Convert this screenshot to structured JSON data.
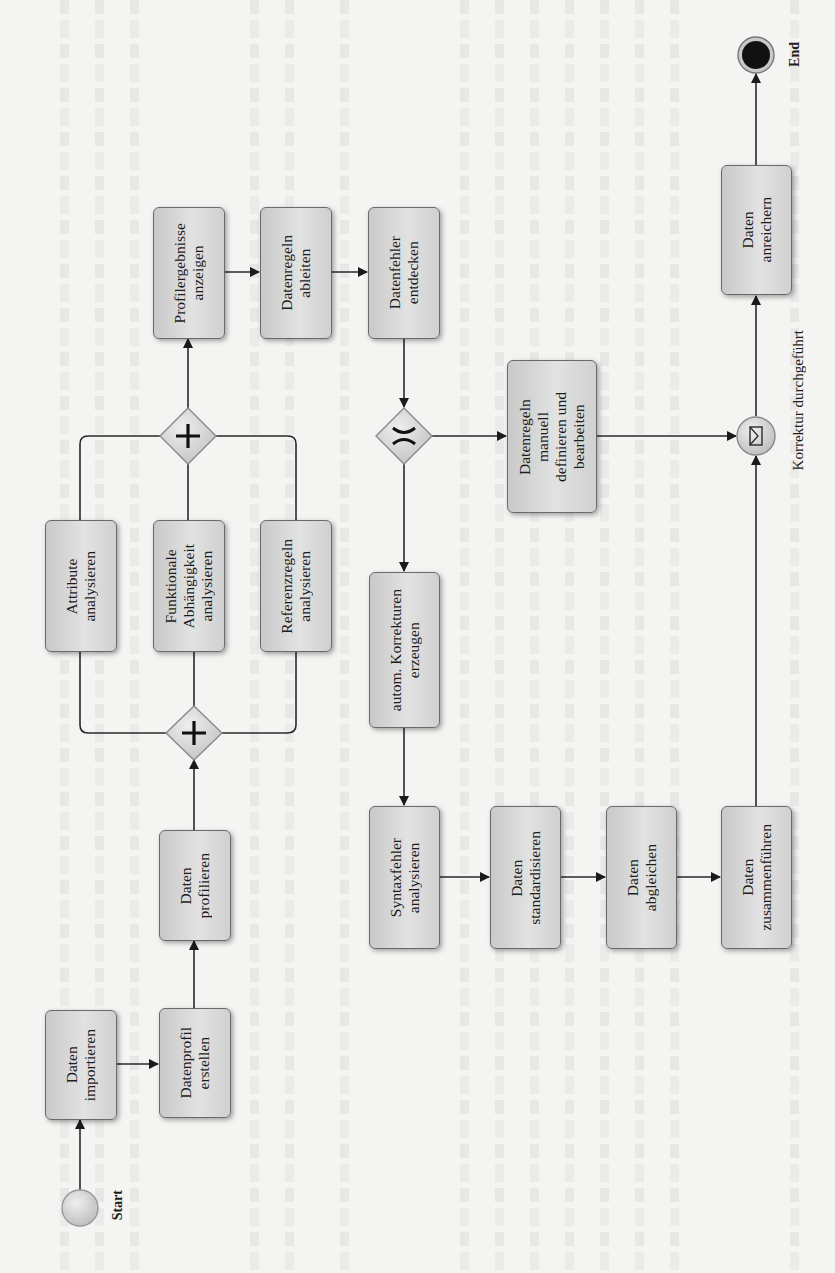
{
  "diagram": {
    "type": "BPMN process (rotated 90°)",
    "events": {
      "start": "Start",
      "end": "End",
      "message": "Korrektur durchgeführt"
    },
    "tasks": {
      "importieren": "Daten\nimportieren",
      "profil_erstellen": "Datenprofil\nerstellen",
      "profilieren": "Daten\nprofilieren",
      "attribute": "Attribute\nanalysieren",
      "funktional": "Funktionale\nAbhängigkeit\nanalysieren",
      "referenz": "Referenzregeln\nanalysieren",
      "profilergebnisse": "Profilergebnisse\nanzeigen",
      "regeln_ableiten": "Datenregeln\nableiten",
      "fehler_entdecken": "Datenfehler\nentdecken",
      "manuell": "Datenregeln\nmanuell\ndefinieren und\nbearbeiten",
      "autom": "autom. Korrekturen\nerzeugen",
      "syntax": "Syntaxfehler\nanalysieren",
      "standardisieren": "Daten\nstandardisieren",
      "abgleichen": "Daten\nabgleichen",
      "zusammenfuehren": "Daten\nzusammenführen",
      "anreichern": "Daten\nanreichern"
    },
    "gateways": {
      "parallel_split": "+",
      "parallel_join": "+",
      "exclusive": "X"
    },
    "colors": {
      "task_fill": "#d6d6d6",
      "stroke": "#2a2a2a",
      "end_fill": "#111111",
      "background": "#f4f4f2"
    }
  }
}
